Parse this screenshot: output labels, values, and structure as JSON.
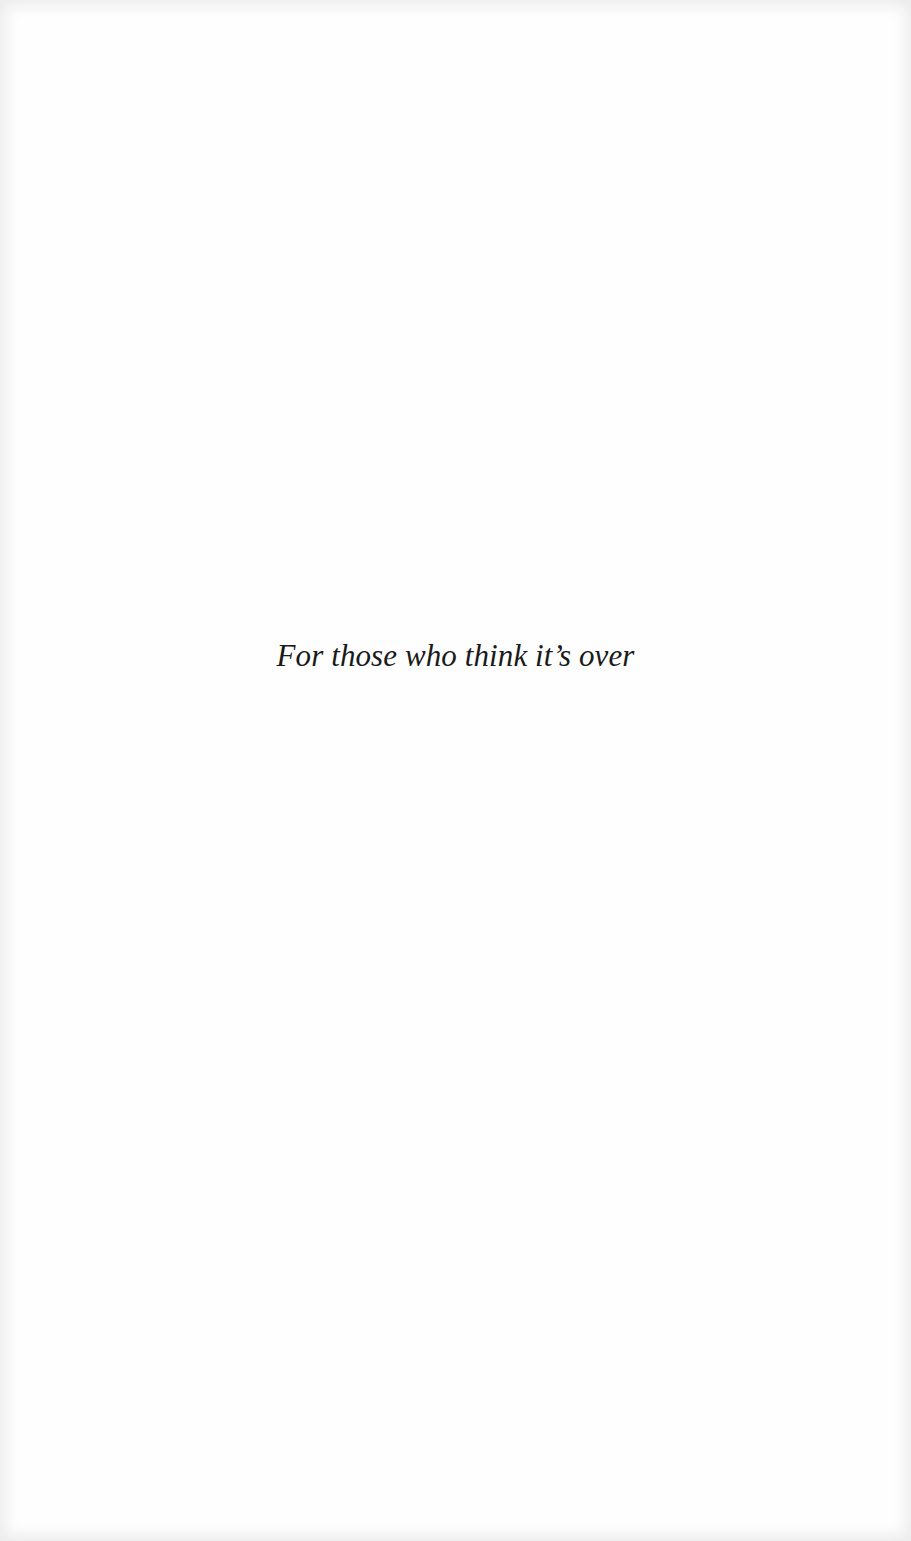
{
  "page": {
    "type": "dedication",
    "dedication_text": "For those who think it’s over"
  }
}
